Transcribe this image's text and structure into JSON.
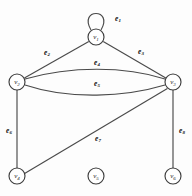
{
  "figure": {
    "type": "undirected-multigraph-diagram",
    "background_color": "#fdfdfd",
    "stroke_color": "#4a4a4a",
    "vertex_fill": "#ffffff",
    "width": 192,
    "height": 196
  },
  "vertices": [
    {
      "id": "v1",
      "letter": "v",
      "subscript": "1",
      "cx": 96,
      "cy": 37,
      "r": 8
    },
    {
      "id": "v2",
      "letter": "v",
      "subscript": "2",
      "cx": 17,
      "cy": 82,
      "r": 8
    },
    {
      "id": "v3",
      "letter": "v",
      "subscript": "3",
      "cx": 173,
      "cy": 82,
      "r": 8
    },
    {
      "id": "v4",
      "letter": "v",
      "subscript": "4",
      "cx": 17,
      "cy": 176,
      "r": 8
    },
    {
      "id": "v5",
      "letter": "v",
      "subscript": "5",
      "cx": 96,
      "cy": 176,
      "r": 8
    },
    {
      "id": "v6",
      "letter": "v",
      "subscript": "6",
      "cx": 173,
      "cy": 176,
      "r": 8
    }
  ],
  "edges": [
    {
      "id": "e1",
      "letter": "e",
      "subscript": "1",
      "from": "v1",
      "to": "v1",
      "kind": "self-loop",
      "path": "M 91 30 C 78 8, 114 8, 101 30",
      "label_x": 118,
      "label_y": 18
    },
    {
      "id": "e2",
      "letter": "e",
      "subscript": "2",
      "from": "v1",
      "to": "v2",
      "kind": "straight",
      "path": "M 88.8 41.6 L 24.4 78.0",
      "label_x": 47,
      "label_y": 52
    },
    {
      "id": "e3",
      "letter": "e",
      "subscript": "3",
      "from": "v1",
      "to": "v3",
      "kind": "straight",
      "path": "M 103.2 41.6 L 165.8 78.0",
      "label_x": 141,
      "label_y": 51
    },
    {
      "id": "e4",
      "letter": "e",
      "subscript": "4",
      "from": "v2",
      "to": "v3",
      "kind": "curve-up",
      "path": "M 25 79 C 70 66, 125 66, 165 79",
      "label_x": 97,
      "label_y": 62
    },
    {
      "id": "e5",
      "letter": "e",
      "subscript": "5",
      "from": "v2",
      "to": "v3",
      "kind": "curve-down",
      "path": "M 25 85 C 70 100, 125 97, 165 85",
      "label_x": 97,
      "label_y": 83
    },
    {
      "id": "e6",
      "letter": "e",
      "subscript": "6",
      "from": "v2",
      "to": "v4",
      "kind": "straight",
      "path": "M 17 90 L 17 168",
      "label_x": 9,
      "label_y": 130
    },
    {
      "id": "e7",
      "letter": "e",
      "subscript": "7",
      "from": "v4",
      "to": "v3",
      "kind": "straight",
      "path": "M 24.6 173.5 L 167.4 88.6",
      "label_x": 98,
      "label_y": 138
    },
    {
      "id": "e8",
      "letter": "e",
      "subscript": "8",
      "from": "v3",
      "to": "v6",
      "kind": "straight",
      "path": "M 173 90 L 173 168",
      "label_x": 182,
      "label_y": 130
    }
  ]
}
